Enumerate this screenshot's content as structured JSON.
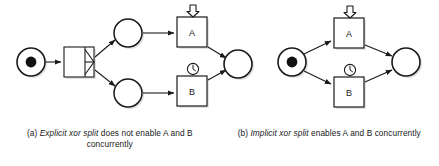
{
  "figure": {
    "background_color": "#ffffff",
    "stroke_color": "#1a1a1a",
    "fill_color": "#ffffff",
    "shadow_color": "#b4b4b4"
  },
  "diagram_a": {
    "id": "a",
    "label": "explicit-xor-split-net",
    "places": [
      {
        "name": "start-place",
        "token": true,
        "token_count": 1,
        "cx": 31,
        "cy": 62,
        "r": 14
      },
      {
        "name": "place-upper",
        "token": false,
        "cx": 128,
        "cy": 33,
        "r": 14
      },
      {
        "name": "place-lower",
        "token": false,
        "cx": 128,
        "cy": 93,
        "r": 14
      },
      {
        "name": "end-place",
        "token": false,
        "cx": 238,
        "cy": 64,
        "r": 14
      }
    ],
    "split_transition": {
      "name": "xor-split-transition",
      "kind": "explicit-xor-split",
      "x": 64,
      "y": 47,
      "w": 30,
      "h": 30
    },
    "tasks": [
      {
        "name": "task-a",
        "label": "A",
        "x": 177,
        "y": 17,
        "w": 30,
        "h": 30,
        "trigger": {
          "icon": "down-arrow-icon",
          "meaning": "message-trigger"
        }
      },
      {
        "name": "task-b",
        "label": "B",
        "x": 177,
        "y": 76,
        "w": 30,
        "h": 30,
        "trigger": {
          "icon": "clock-icon",
          "meaning": "timer-trigger"
        }
      }
    ]
  },
  "diagram_b": {
    "id": "b",
    "label": "implicit-xor-split-net",
    "places": [
      {
        "name": "start-place",
        "token": true,
        "token_count": 1,
        "cx": 292,
        "cy": 62,
        "r": 14
      },
      {
        "name": "end-place",
        "token": false,
        "cx": 406,
        "cy": 62,
        "r": 14
      }
    ],
    "tasks": [
      {
        "name": "task-a",
        "label": "A",
        "x": 334,
        "y": 18,
        "w": 30,
        "h": 30,
        "trigger": {
          "icon": "down-arrow-icon",
          "meaning": "message-trigger"
        }
      },
      {
        "name": "task-b",
        "label": "B",
        "x": 334,
        "y": 77,
        "w": 30,
        "h": 30,
        "trigger": {
          "icon": "clock-icon",
          "meaning": "timer-trigger"
        }
      }
    ]
  },
  "captions": {
    "a": {
      "prefix": "(a) ",
      "emphasis": "Explicit xor split",
      "suffix": " does not enable A and B concurrently",
      "full": "(a) Explicit xor split does not enable A and B concurrently"
    },
    "b": {
      "prefix": "(b) ",
      "emphasis": "Implicit xor split",
      "suffix": " enables A and B concurrently",
      "full": "(b) Implicit xor split enables A and B concurrently"
    }
  }
}
